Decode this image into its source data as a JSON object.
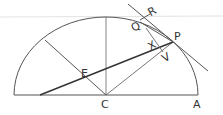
{
  "diagram": {
    "type": "geometry",
    "labels": {
      "C": "C",
      "A": "A",
      "E": "E",
      "P": "P",
      "Q": "Q",
      "R": "R",
      "X": "X",
      "V": "V"
    },
    "colors": {
      "stroke": "#555555",
      "thick_stroke": "#333333",
      "faint": "#dddddd"
    }
  }
}
